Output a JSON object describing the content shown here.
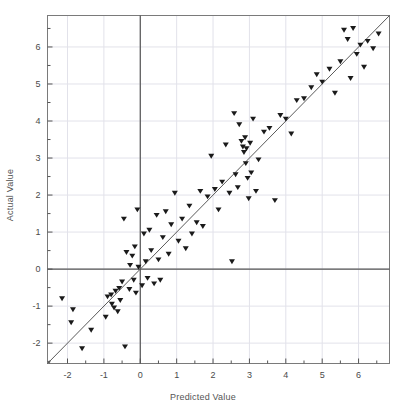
{
  "chart_data": {
    "type": "scatter",
    "title": "",
    "xlabel": "Predicted Value",
    "ylabel": "Actual Value",
    "xlim": [
      -2.55,
      6.85
    ],
    "ylim": [
      -2.55,
      6.85
    ],
    "grid": true,
    "legend": null,
    "marker": "down-triangle",
    "marker_color": "#1a1a1a",
    "marker_size": 6,
    "xticks": [
      -2,
      -1,
      0,
      1,
      2,
      3,
      4,
      5,
      6
    ],
    "yticks": [
      -2,
      -1,
      0,
      1,
      2,
      3,
      4,
      5,
      6
    ],
    "xtick_labels": [
      "-2",
      "-1",
      "0",
      "1",
      "2",
      "3",
      "4",
      "5",
      "6"
    ],
    "ytick_labels": [
      "-2",
      "-1",
      "0",
      "1",
      "2",
      "3",
      "4",
      "5",
      "6"
    ],
    "minor_tick_step": 0.5,
    "reference_line": {
      "type": "identity",
      "label": "y = x",
      "color": "#5a5a5a",
      "from": [
        -2.55,
        -2.55
      ],
      "to": [
        6.85,
        6.85
      ]
    },
    "zero_lines": {
      "x": 0,
      "y": 0,
      "color": "#555555"
    },
    "points": [
      [
        -2.15,
        -0.8
      ],
      [
        -1.9,
        -1.45
      ],
      [
        -1.85,
        -1.1
      ],
      [
        -1.6,
        -2.15
      ],
      [
        -1.35,
        -1.65
      ],
      [
        -0.95,
        -1.3
      ],
      [
        -0.9,
        -0.75
      ],
      [
        -0.8,
        -0.7
      ],
      [
        -0.78,
        -0.95
      ],
      [
        -0.72,
        -1.05
      ],
      [
        -0.68,
        -0.6
      ],
      [
        -0.62,
        -1.15
      ],
      [
        -0.58,
        -0.52
      ],
      [
        -0.55,
        -0.85
      ],
      [
        -0.5,
        -0.35
      ],
      [
        -0.45,
        1.35
      ],
      [
        -0.42,
        -2.1
      ],
      [
        -0.38,
        0.45
      ],
      [
        -0.3,
        -0.55
      ],
      [
        -0.28,
        0.1
      ],
      [
        -0.22,
        0.35
      ],
      [
        -0.18,
        -0.3
      ],
      [
        -0.15,
        0.6
      ],
      [
        -0.12,
        -0.65
      ],
      [
        -0.08,
        1.6
      ],
      [
        -0.05,
        0.05
      ],
      [
        0.05,
        -0.45
      ],
      [
        0.1,
        0.95
      ],
      [
        0.15,
        0.2
      ],
      [
        0.2,
        -0.25
      ],
      [
        0.25,
        1.05
      ],
      [
        0.3,
        0.5
      ],
      [
        0.38,
        -0.4
      ],
      [
        0.45,
        1.45
      ],
      [
        0.5,
        0.25
      ],
      [
        0.55,
        -0.3
      ],
      [
        0.62,
        0.85
      ],
      [
        0.7,
        1.55
      ],
      [
        0.78,
        0.4
      ],
      [
        0.85,
        1.2
      ],
      [
        0.95,
        2.05
      ],
      [
        1.05,
        0.75
      ],
      [
        1.15,
        1.35
      ],
      [
        1.25,
        0.55
      ],
      [
        1.35,
        1.7
      ],
      [
        1.42,
        0.95
      ],
      [
        1.55,
        1.25
      ],
      [
        1.65,
        2.1
      ],
      [
        1.72,
        1.15
      ],
      [
        1.85,
        1.95
      ],
      [
        1.95,
        3.05
      ],
      [
        2.05,
        2.15
      ],
      [
        2.15,
        1.6
      ],
      [
        2.25,
        2.35
      ],
      [
        2.35,
        3.35
      ],
      [
        2.45,
        2.05
      ],
      [
        2.52,
        0.2
      ],
      [
        2.58,
        4.2
      ],
      [
        2.62,
        2.55
      ],
      [
        2.68,
        2.2
      ],
      [
        2.72,
        3.9
      ],
      [
        2.78,
        3.45
      ],
      [
        2.82,
        3.3
      ],
      [
        2.85,
        3.15
      ],
      [
        2.88,
        3.55
      ],
      [
        2.9,
        2.85
      ],
      [
        2.92,
        3.25
      ],
      [
        2.95,
        2.45
      ],
      [
        2.98,
        1.9
      ],
      [
        3.02,
        3.4
      ],
      [
        3.05,
        2.6
      ],
      [
        3.1,
        4.05
      ],
      [
        3.18,
        2.1
      ],
      [
        3.25,
        2.95
      ],
      [
        3.4,
        3.7
      ],
      [
        3.55,
        3.8
      ],
      [
        3.7,
        1.85
      ],
      [
        3.85,
        4.15
      ],
      [
        4.0,
        4.05
      ],
      [
        4.15,
        3.65
      ],
      [
        4.3,
        4.55
      ],
      [
        4.5,
        4.6
      ],
      [
        4.7,
        4.9
      ],
      [
        4.85,
        5.25
      ],
      [
        5.0,
        5.05
      ],
      [
        5.2,
        5.4
      ],
      [
        5.35,
        4.75
      ],
      [
        5.5,
        5.6
      ],
      [
        5.6,
        6.45
      ],
      [
        5.7,
        6.2
      ],
      [
        5.78,
        5.15
      ],
      [
        5.85,
        6.5
      ],
      [
        5.95,
        5.8
      ],
      [
        6.05,
        6.05
      ],
      [
        6.15,
        5.45
      ],
      [
        6.25,
        6.15
      ],
      [
        6.4,
        5.95
      ],
      [
        6.55,
        6.35
      ]
    ]
  },
  "plot": {
    "frame_color": "#7a7a7a",
    "grid_color": "#e2e2ea",
    "background": "#ffffff"
  }
}
